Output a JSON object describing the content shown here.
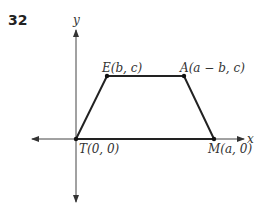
{
  "problem_number": "32",
  "axes": {
    "x_label": "x",
    "y_label": "y"
  },
  "points": [
    {
      "id": "T",
      "label": "T(0, 0)",
      "x": 76,
      "y": 139
    },
    {
      "id": "E",
      "label": "E(b, c)",
      "x": 107,
      "y": 76
    },
    {
      "id": "A",
      "label": "A(a − b, c)",
      "x": 184,
      "y": 76
    },
    {
      "id": "M",
      "label": "M(a, 0)",
      "x": 214,
      "y": 139
    }
  ],
  "labels": {
    "T": "T(0, 0)",
    "E": "E(b, c)",
    "A": "A(a − b, c)",
    "M": "M(a, 0)"
  }
}
